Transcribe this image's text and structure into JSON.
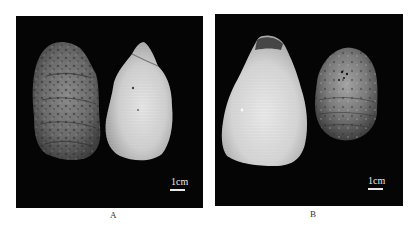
{
  "figure": {
    "panels": [
      {
        "id": "A",
        "label": "A",
        "scale_bar": "1cm",
        "specimens": [
          {
            "view": "exterior (left valve)",
            "tone": "grey-mottled"
          },
          {
            "view": "interior",
            "tone": "pale-white"
          }
        ]
      },
      {
        "id": "B",
        "label": "B",
        "scale_bar": "1cm",
        "specimens": [
          {
            "view": "interior",
            "tone": "pale-white"
          },
          {
            "view": "exterior",
            "tone": "grey-mottled"
          }
        ]
      }
    ],
    "colors": {
      "background": "#ffffff",
      "panel_bg": "#050505",
      "scale_color": "#e8e8e8"
    }
  }
}
